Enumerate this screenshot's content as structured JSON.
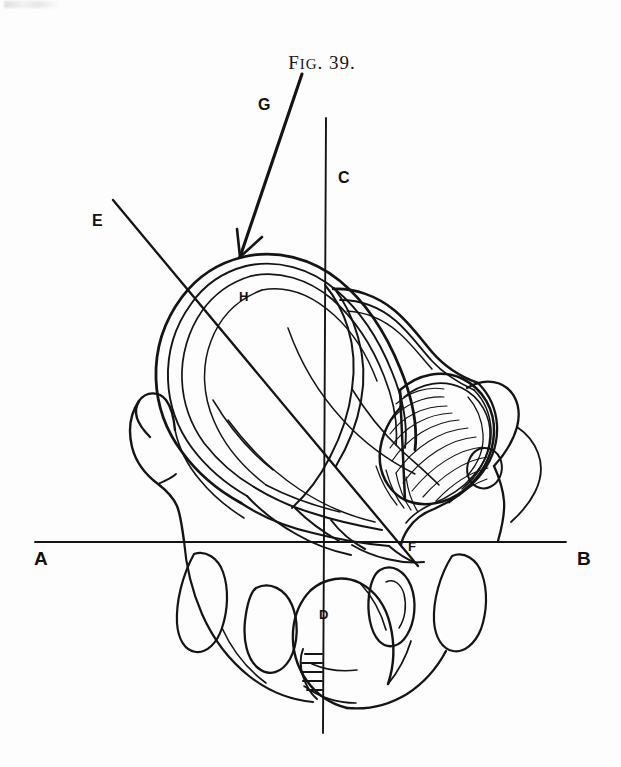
{
  "figure": {
    "caption_lead": "F",
    "caption_rest": "IG",
    "caption_tail": ". 39.",
    "caption_full": "FIG. 39.",
    "title_text": "FIG. 39."
  },
  "labels": {
    "a": "A",
    "b": "B",
    "c": "C",
    "d": "D",
    "e": "E",
    "f": "F",
    "g": "G",
    "h": "H"
  },
  "geometry": {
    "horizontal_axis": {
      "name": "A-B",
      "x1": 35,
      "y1": 542,
      "x2": 566,
      "y2": 542
    },
    "vertical_axis": {
      "name": "C-D",
      "x1": 326,
      "y1": 118,
      "x2": 323,
      "y2": 733
    },
    "oblique_axis": {
      "name": "E-F",
      "x1": 113,
      "y1": 200,
      "x2": 418,
      "y2": 566
    },
    "pointer_arrow": {
      "name": "G",
      "x1": 302,
      "y1": 74,
      "x2": 240,
      "y2": 257
    }
  },
  "colors": {
    "ink": "#141414",
    "paper": "#fdfdfd",
    "axis": "#141414"
  },
  "stroke_widths": {
    "axis": 1.9,
    "pointer": 3.0,
    "outline_heavy": 3.0,
    "outline_medium": 2.0,
    "outline_light": 1.4,
    "hatch": 1.2
  }
}
